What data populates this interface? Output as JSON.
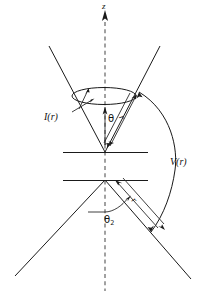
{
  "figure": {
    "kind": "physics-diagram",
    "background_color": "#ffffff",
    "line_color": "#1a1a1a",
    "axis_color": "#555555"
  },
  "labels": {
    "axis_z": "z",
    "intensity": "I(r)",
    "potential": "V(r)",
    "angle_upper": "θ",
    "angle_lower_base": "θ",
    "angle_lower_sub": "2",
    "radius_upper": "r",
    "radius_lower": "r"
  },
  "elements": {
    "upper_cone": "two rays from apex diverging upward",
    "lower_cone": "two rays from apex diverging downward",
    "ellipse": "cone mouth ellipse",
    "upper_plate": "horizontal line at upper cone apex",
    "lower_plate": "horizontal line at lower cone apex",
    "arc": "large arc on right spanning both cones",
    "z_axis": "vertical dashed line with upward arrow"
  }
}
